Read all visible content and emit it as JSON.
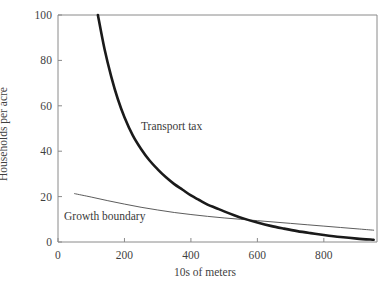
{
  "chart_data": {
    "type": "line",
    "title": "",
    "xlabel": "10s of meters",
    "ylabel": "Households per acre",
    "xlim": [
      0,
      960
    ],
    "ylim": [
      0,
      100
    ],
    "grid": false,
    "legend_position": "inline-annotations",
    "xticks": [
      0,
      200,
      400,
      600,
      800
    ],
    "xtick_labels": [
      "0",
      "200",
      "400",
      "600",
      "800"
    ],
    "yticks": [
      0,
      20,
      40,
      60,
      80,
      100
    ],
    "ytick_labels": [
      "0",
      "20",
      "40",
      "60",
      "80",
      "100"
    ],
    "series": [
      {
        "name": "Transport tax",
        "style": "thick",
        "color": "#1a1a1a",
        "x": [
          120,
          140,
          160,
          180,
          200,
          225,
          250,
          275,
          300,
          325,
          350,
          375,
          400,
          425,
          450,
          475,
          500,
          530,
          560,
          600,
          640,
          680,
          720,
          760,
          800,
          850,
          900,
          950
        ],
        "y": [
          100,
          85,
          73,
          63,
          55,
          47,
          41,
          36,
          32,
          28.5,
          25.5,
          23,
          20.5,
          18.5,
          16.5,
          15,
          13.5,
          11.8,
          10.3,
          8.6,
          7.1,
          5.9,
          4.8,
          3.9,
          3.1,
          2.2,
          1.5,
          1.0
        ]
      },
      {
        "name": "Growth boundary",
        "style": "thin",
        "color": "#4a4a4a",
        "x": [
          50,
          100,
          150,
          200,
          250,
          300,
          350,
          400,
          450,
          500,
          550,
          600,
          650,
          700,
          750,
          800,
          850,
          900,
          950
        ],
        "y": [
          21.3,
          19.8,
          18.2,
          16.7,
          15.3,
          14.1,
          13.0,
          12.1,
          11.3,
          10.6,
          10.0,
          9.4,
          8.8,
          8.2,
          7.6,
          7.0,
          6.4,
          5.8,
          5.2
        ]
      }
    ],
    "annotations": [
      {
        "text": "Transport tax",
        "x": 400,
        "y": 47
      },
      {
        "text": "Growth boundary",
        "x": 140,
        "y": 10
      }
    ]
  },
  "axes": {
    "x_title": "10s of meters",
    "y_title": "Households per acre",
    "x_tick_labels": [
      "0",
      "200",
      "400",
      "600",
      "800"
    ],
    "y_tick_labels": [
      "0",
      "20",
      "40",
      "60",
      "80",
      "100"
    ]
  },
  "labels": {
    "transport_tax": "Transport tax",
    "growth_boundary": "Growth boundary"
  },
  "colors": {
    "background": "#ffffff",
    "frame": "#8a8a8a",
    "thick_curve": "#1a1a1a",
    "thin_curve": "#4a4a4a",
    "text": "#3a3a3a"
  }
}
